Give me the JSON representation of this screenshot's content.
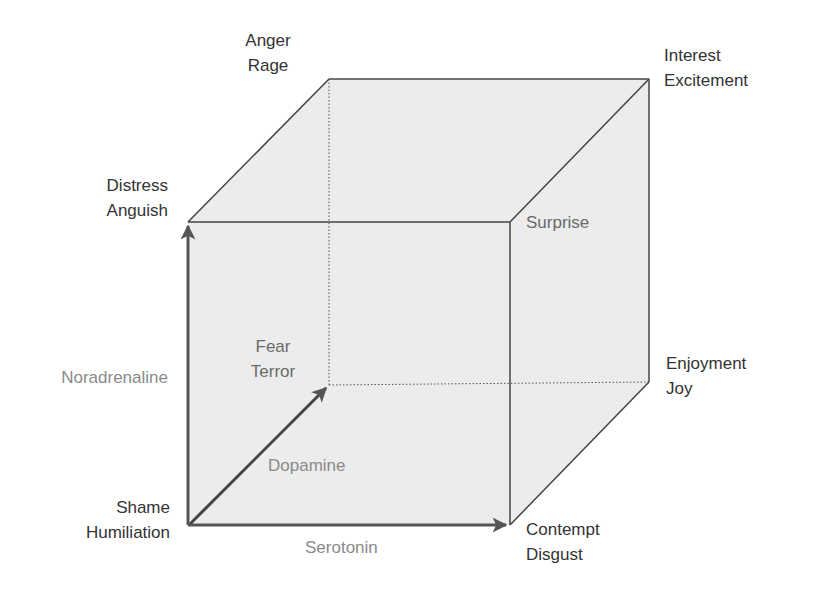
{
  "diagram": {
    "axes": {
      "vertical": "Noradrenaline",
      "depth": "Dopamine",
      "horizontal": "Serotonin"
    },
    "corners": {
      "front_bottom_left": [
        "Shame",
        "Humiliation"
      ],
      "front_top_left": [
        "Distress",
        "Anguish"
      ],
      "back_top_left": [
        "Anger",
        "Rage"
      ],
      "back_top_right": [
        "Interest",
        "Excitement"
      ],
      "front_top_right": [
        "Surprise"
      ],
      "back_bottom_right": [
        "Enjoyment",
        "Joy"
      ],
      "front_bottom_right": [
        "Contempt",
        "Disgust"
      ],
      "back_bottom_left": [
        "Fear",
        "Terror"
      ]
    },
    "colors": {
      "face_fill": "#ececec",
      "edge": "#444444",
      "arrow": "#555555",
      "axis_label": "#8a8a8a"
    }
  }
}
